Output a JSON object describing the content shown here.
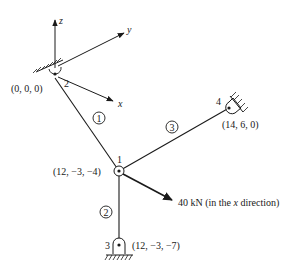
{
  "diagram": {
    "type": "3D truss structure",
    "axes": {
      "x_label": "x",
      "y_label": "y",
      "z_label": "z"
    },
    "nodes": [
      {
        "id": "1",
        "label": "1",
        "coords": "(12, −3, −4)",
        "support": "none"
      },
      {
        "id": "2",
        "label": "2",
        "coords": "(0, 0, 0)",
        "support": "pin"
      },
      {
        "id": "3",
        "label": "3",
        "coords": "(12, −3, −7)",
        "support": "pin"
      },
      {
        "id": "4",
        "label": "4",
        "coords": "(14, 6, 0)",
        "support": "pin"
      }
    ],
    "elements": [
      {
        "id": "1",
        "label": "1",
        "from": "2",
        "to": "1"
      },
      {
        "id": "2",
        "label": "2",
        "from": "1",
        "to": "3"
      },
      {
        "id": "3",
        "label": "3",
        "from": "1",
        "to": "4"
      }
    ],
    "load": {
      "node": "1",
      "magnitude": "40 kN",
      "text_prefix": "40 kN (in the ",
      "text_axis": "x",
      "text_suffix": " direction)"
    }
  }
}
